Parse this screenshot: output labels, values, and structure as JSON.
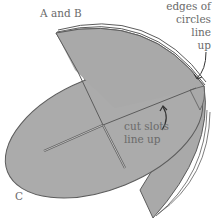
{
  "diagram": {
    "labels": {
      "ab": "A and B",
      "edges_line1": "edges of",
      "edges_line2": "circles",
      "edges_line3": "line",
      "edges_line4": "up",
      "slots_line1": "cut slots",
      "slots_line2": "line up",
      "c": "C"
    },
    "colors": {
      "fill": "#a9a9a9",
      "stroke": "#5c5c5c",
      "label": "#6a6a6a"
    }
  }
}
